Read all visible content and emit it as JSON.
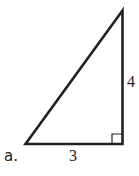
{
  "figure": {
    "problem_label": "a.",
    "side_labels": {
      "base": "3",
      "height": "4"
    },
    "shape": "right-triangle",
    "right_angle_marker": true,
    "stroke_color": "#222222"
  }
}
